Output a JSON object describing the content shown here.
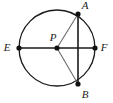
{
  "figure": {
    "type": "geometry-diagram",
    "background_color": "#ffffff",
    "stroke_color": "#1a1a1a",
    "radius_stroke_color": "#6b6b6b",
    "point_fill_color": "#111111",
    "width": 113,
    "height": 103
  },
  "circle": {
    "name": "circle-P",
    "center_x": 57,
    "center_y": 48,
    "radius": 38,
    "stroke_width": 1.3
  },
  "points": [
    {
      "id": "A",
      "label": "A",
      "x": 78,
      "y": 14,
      "label_x": 85,
      "label_y": 6,
      "dot_radius": 2.6
    },
    {
      "id": "B",
      "label": "B",
      "x": 78,
      "y": 84,
      "label_x": 85,
      "label_y": 95,
      "dot_radius": 2.6
    },
    {
      "id": "E",
      "label": "E",
      "x": 19,
      "y": 48,
      "label_x": 7,
      "label_y": 48,
      "dot_radius": 2.6
    },
    {
      "id": "F",
      "label": "F",
      "x": 95,
      "y": 48,
      "label_x": 104,
      "label_y": 48,
      "dot_radius": 2.6
    },
    {
      "id": "P",
      "label": "P",
      "x": 57,
      "y": 48,
      "label_x": 53,
      "label_y": 38,
      "dot_radius": 2.6
    }
  ],
  "segments": [
    {
      "id": "EF",
      "name": "diameter-ef",
      "kind": "diameter",
      "x1": 19,
      "y1": 48,
      "x2": 95,
      "y2": 48,
      "stroke": "#1a1a1a",
      "stroke_width": 1.6
    },
    {
      "id": "AB",
      "name": "chord-ab",
      "kind": "chord",
      "x1": 78,
      "y1": 14,
      "x2": 78,
      "y2": 84,
      "stroke": "#1a1a1a",
      "stroke_width": 1.6
    },
    {
      "id": "PA",
      "name": "radius-pa",
      "kind": "radius",
      "x1": 57,
      "y1": 48,
      "x2": 78,
      "y2": 14,
      "stroke": "#6b6b6b",
      "stroke_width": 1.1
    },
    {
      "id": "PB",
      "name": "radius-pb",
      "kind": "radius",
      "x1": 57,
      "y1": 48,
      "x2": 78,
      "y2": 84,
      "stroke": "#6b6b6b",
      "stroke_width": 1.1
    }
  ],
  "labels": {
    "A": "A",
    "B": "B",
    "E": "E",
    "F": "F",
    "P": "P"
  }
}
